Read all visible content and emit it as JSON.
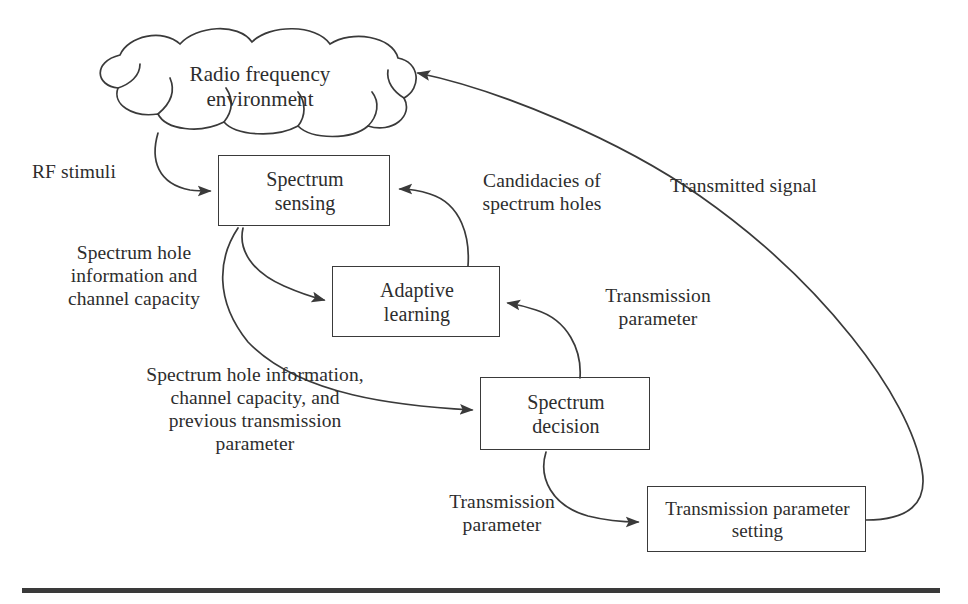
{
  "figure": {
    "type": "diagram",
    "kind": "flow-diagram",
    "title_visible": false,
    "stroke_color": "#3a3a3a",
    "text_color": "#2d2d2d",
    "background": "#ffffff"
  },
  "nodes": {
    "cloud": {
      "id": "radio-frequency-environment",
      "shape": "cloud",
      "label": "Radio frequency\nenvironment"
    },
    "boxes": [
      {
        "id": "spectrum-sensing",
        "shape": "rectangle",
        "label": "Spectrum\nsensing"
      },
      {
        "id": "adaptive-learning",
        "shape": "rectangle",
        "label": "Adaptive\nlearning"
      },
      {
        "id": "spectrum-decision",
        "shape": "rectangle",
        "label": "Spectrum\ndecision"
      },
      {
        "id": "transmission-parameter-setting",
        "shape": "rectangle",
        "label": "Transmission parameter\nsetting"
      }
    ]
  },
  "edges": [
    {
      "id": "cloud-to-spectrum-sensing",
      "from": "radio-frequency-environment",
      "to": "spectrum-sensing",
      "label": "RF stimuli"
    },
    {
      "id": "spectrum-sensing-to-adaptive-learning",
      "from": "spectrum-sensing",
      "to": "adaptive-learning",
      "label": "Spectrum hole\ninformation and\nchannel capacity"
    },
    {
      "id": "spectrum-sensing-to-spectrum-decision",
      "from": "spectrum-sensing",
      "to": "spectrum-decision",
      "label": "Spectrum hole information,\nchannel capacity, and\nprevious transmission\nparameter"
    },
    {
      "id": "adaptive-learning-to-spectrum-sensing",
      "from": "adaptive-learning",
      "to": "spectrum-sensing",
      "label": "Candidacies of\nspectrum holes"
    },
    {
      "id": "spectrum-decision-to-adaptive-learning",
      "from": "spectrum-decision",
      "to": "adaptive-learning",
      "label": "Transmission\nparameter"
    },
    {
      "id": "spectrum-decision-to-transmission-parameter-setting",
      "from": "spectrum-decision",
      "to": "transmission-parameter-setting",
      "label": "Transmission\nparameter"
    },
    {
      "id": "transmission-parameter-setting-to-cloud",
      "from": "transmission-parameter-setting",
      "to": "radio-frequency-environment",
      "label": "Transmitted signal"
    }
  ],
  "rule": {
    "id": "bottom-rule",
    "present": true
  }
}
